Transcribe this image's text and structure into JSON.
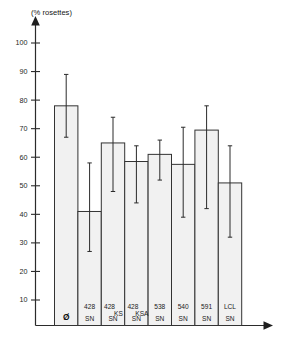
{
  "chart_data": {
    "type": "bar",
    "title": "",
    "subtitle": "",
    "xlabel": "",
    "ylabel": "(% rosettes)",
    "ylim": [
      0,
      105
    ],
    "yticks": [
      10,
      20,
      30,
      40,
      50,
      60,
      70,
      80,
      90,
      100
    ],
    "ytick_labels": [
      "10",
      "20",
      "30",
      "40",
      "50",
      "60",
      "70",
      "80",
      "90",
      "100"
    ],
    "grid": false,
    "legend": null,
    "error_bar_style": "vertical line with short end caps",
    "categories": [
      "Ø",
      "428 SN",
      "428 KS SN",
      "428 KSA SN",
      "538 SN",
      "540 SN",
      "591 SN",
      "LCL SN"
    ],
    "category_lines": [
      [
        "Ø",
        ""
      ],
      [
        "428",
        "SN"
      ],
      [
        "428 KS",
        "SN"
      ],
      [
        "428 KSA",
        "SN"
      ],
      [
        "538",
        "SN"
      ],
      [
        "540",
        "SN"
      ],
      [
        "591",
        "SN"
      ],
      [
        "LCL",
        "SN"
      ]
    ],
    "values": [
      78,
      41,
      65,
      58.5,
      61,
      57.5,
      69.5,
      51
    ],
    "err_low": [
      67,
      27,
      48,
      44,
      52,
      39,
      42,
      32
    ],
    "err_high": [
      89,
      58,
      74,
      64,
      66,
      70.5,
      78,
      64
    ],
    "bar_fill": "#f1f1f1",
    "bar_stroke": "#333333",
    "axis_color": "#2b2b2b",
    "series": [
      {
        "name": "% rosettes",
        "values": [
          78,
          41,
          65,
          58.5,
          61,
          57.5,
          69.5,
          51
        ]
      }
    ]
  },
  "figure": {
    "y_axis_title": "(% rosettes)",
    "x_axis_arrow": "arrow-right",
    "y_axis_arrow": "arrow-up"
  }
}
